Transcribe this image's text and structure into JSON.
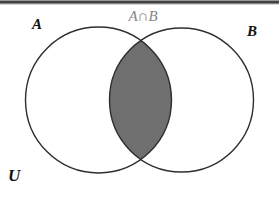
{
  "diagram": {
    "type": "venn",
    "labels": {
      "set_a": "A",
      "set_b": "B",
      "universe": "U",
      "intersection": "A∩B"
    },
    "shaded_region": "A∩B",
    "colors": {
      "intersection_fill": "#6f6f6f",
      "circle_stroke": "#2e2e2e",
      "intersection_label": "#858585",
      "set_label": "#111111",
      "background": "#ffffff"
    }
  }
}
